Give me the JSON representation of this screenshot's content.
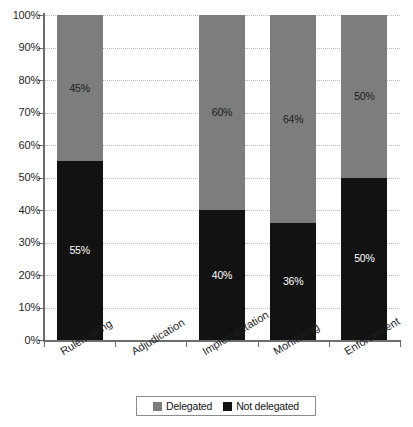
{
  "chart_data": {
    "type": "bar",
    "subtype": "stacked-bar-100-percent",
    "title": "",
    "xlabel": "",
    "ylabel": "",
    "ylim": [
      0,
      100
    ],
    "yticks": [
      "0%",
      "10%",
      "20%",
      "30%",
      "40%",
      "50%",
      "60%",
      "70%",
      "80%",
      "90%",
      "100%"
    ],
    "ytick_values": [
      0,
      10,
      20,
      30,
      40,
      50,
      60,
      70,
      80,
      90,
      100
    ],
    "grid": true,
    "grid_style": "dotted-horizontal",
    "legend_position": "bottom-center",
    "categories": [
      "Rulemaking",
      "Adjudication",
      "Implementation",
      "Monitoring",
      "Enforcement"
    ],
    "series": [
      {
        "name": "Not delegated",
        "color": "#121212",
        "stack_position": "bottom",
        "values": [
          55,
          0,
          40,
          36,
          50
        ],
        "labels": [
          "55%",
          "",
          "40%",
          "36%",
          "50%"
        ]
      },
      {
        "name": "Delegated",
        "color": "#7d7d7d",
        "stack_position": "top",
        "values": [
          45,
          0,
          60,
          64,
          50
        ],
        "labels": [
          "45%",
          "",
          "60%",
          "64%",
          "50%"
        ]
      }
    ],
    "bars": [
      {
        "category": "Rulemaking",
        "not_delegated": 55,
        "delegated": 45,
        "not_delegated_label": "55%",
        "delegated_label": "45%",
        "total": 100
      },
      {
        "category": "Adjudication",
        "not_delegated": 0,
        "delegated": 0,
        "not_delegated_label": "",
        "delegated_label": "",
        "total": 0
      },
      {
        "category": "Implementation",
        "not_delegated": 40,
        "delegated": 60,
        "not_delegated_label": "40%",
        "delegated_label": "60%",
        "total": 100
      },
      {
        "category": "Monitoring",
        "not_delegated": 36,
        "delegated": 64,
        "not_delegated_label": "36%",
        "delegated_label": "64%",
        "total": 100
      },
      {
        "category": "Enforcement",
        "not_delegated": 50,
        "delegated": 50,
        "not_delegated_label": "50%",
        "delegated_label": "50%",
        "total": 100
      }
    ],
    "legend": [
      {
        "label": "Delegated",
        "color": "#7d7d7d"
      },
      {
        "label": "Not delegated",
        "color": "#121212"
      }
    ]
  },
  "colors": {
    "delegated": "#7d7d7d",
    "not_delegated": "#121212",
    "axis": "#6d6d6d",
    "grid": "#b9b9c4",
    "background": "#ffffff",
    "text": "#1f1f1f"
  }
}
